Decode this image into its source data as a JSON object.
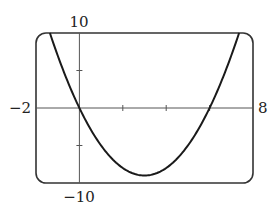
{
  "chart_data": {
    "type": "line",
    "title": "",
    "function": "y = x^2 - 6x",
    "xlabel": "",
    "ylabel": "",
    "xlim": [
      -2,
      8
    ],
    "ylim": [
      -10,
      10
    ],
    "x_ticks": [
      0,
      2,
      4,
      6
    ],
    "y_ticks": [
      -5,
      0,
      5
    ],
    "window_labels": {
      "xmin": "-2",
      "xmax": "8",
      "ymin": "-10",
      "ymax": "10"
    },
    "grid": false,
    "legend": null,
    "series": [
      {
        "name": "f(x)",
        "x": [
          -1.36,
          -1,
          0,
          1,
          2,
          3,
          4,
          5,
          6,
          7,
          7.36
        ],
        "values": [
          10,
          7,
          0,
          -5,
          -8,
          -9,
          -8,
          -5,
          0,
          7,
          10
        ]
      }
    ]
  },
  "labels": {
    "ymax": "10",
    "ymin": "−10",
    "xmin": "−2",
    "xmax": "8"
  },
  "colors": {
    "curve": "#1a1a1a",
    "frame": "#333333",
    "axis": "#555555"
  }
}
